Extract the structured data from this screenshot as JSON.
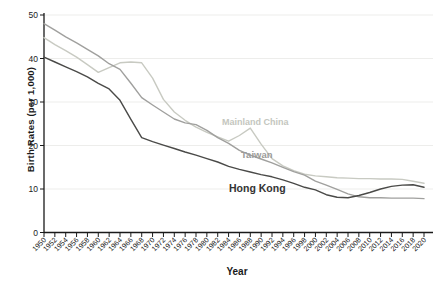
{
  "chart_data": {
    "type": "line",
    "title": "",
    "xlabel": "Year",
    "ylabel": "Birth Rates (per 1,000)",
    "x": [
      1950,
      1952,
      1954,
      1956,
      1958,
      1960,
      1962,
      1964,
      1966,
      1968,
      1970,
      1972,
      1974,
      1976,
      1978,
      1980,
      1982,
      1984,
      1986,
      1988,
      1990,
      1992,
      1994,
      1996,
      1998,
      2000,
      2002,
      2004,
      2006,
      2008,
      2010,
      2012,
      2014,
      2016,
      2018,
      2020
    ],
    "ylim": [
      0,
      50
    ],
    "yticks": [
      0,
      10,
      20,
      30,
      40,
      50
    ],
    "grid": "faint horizontal gridlines at each y tick",
    "legend_position": "inline labels next to lines",
    "axis_color": "#1a1a1a",
    "gridline_color": "#ededeb",
    "series": [
      {
        "name": "Mainland China",
        "color": "#c8cac2",
        "label_color": "#c4c6be",
        "label_pos": {
          "x": 222,
          "y": 125
        },
        "values": [
          44.8,
          43.2,
          41.8,
          40.3,
          38.6,
          36.8,
          37.9,
          39.0,
          39.2,
          39.0,
          35.5,
          30.6,
          27.7,
          25.8,
          24.2,
          23.0,
          22.0,
          21.0,
          22.3,
          24.0,
          20.3,
          17.0,
          15.3,
          14.2,
          13.4,
          13.0,
          12.8,
          12.6,
          12.5,
          12.4,
          12.4,
          12.3,
          12.3,
          12.2,
          11.8,
          11.3
        ]
      },
      {
        "name": "Taiwan",
        "color": "#a0a09e",
        "label_color": "#9b9b99",
        "label_pos": {
          "x": 241,
          "y": 158
        },
        "values": [
          48.0,
          46.5,
          45.0,
          43.6,
          42.1,
          40.6,
          38.8,
          37.5,
          34.3,
          31.0,
          29.3,
          27.7,
          26.1,
          25.2,
          24.8,
          23.5,
          21.8,
          20.5,
          18.9,
          17.8,
          16.9,
          16.0,
          15.0,
          14.0,
          13.2,
          11.8,
          10.9,
          9.9,
          8.9,
          8.2,
          8.0,
          8.0,
          7.9,
          7.9,
          7.9,
          7.8
        ]
      },
      {
        "name": "Hong Kong",
        "color": "#4a4a48",
        "label_color": "#333333",
        "label_pos": {
          "x": 229,
          "y": 192
        },
        "values": [
          40.3,
          39.2,
          38.1,
          37.0,
          35.8,
          34.3,
          33.0,
          30.4,
          26.0,
          21.8,
          20.9,
          20.1,
          19.3,
          18.5,
          17.8,
          17.0,
          16.2,
          15.2,
          14.5,
          13.9,
          13.3,
          12.8,
          12.1,
          11.3,
          10.4,
          9.8,
          8.7,
          8.1,
          8.0,
          8.5,
          9.2,
          10.0,
          10.6,
          10.9,
          11.0,
          10.4
        ]
      }
    ]
  }
}
